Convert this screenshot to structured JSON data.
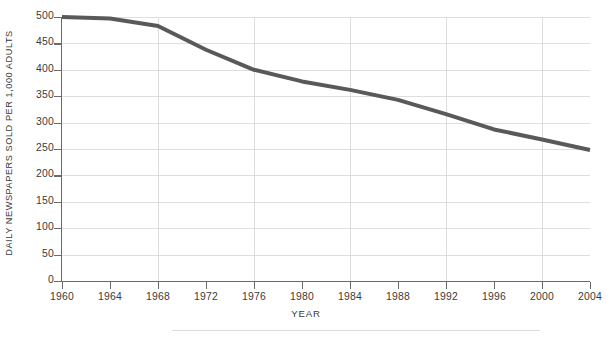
{
  "chart_data": {
    "type": "line",
    "title": "",
    "xlabel": "YEAR",
    "ylabel": "DAILY NEWSPAPERS SOLD PER 1,000 ADULTS",
    "xlim": [
      1960,
      2004
    ],
    "ylim": [
      0,
      500
    ],
    "grid": true,
    "legend_position": "none",
    "x_tick_labels": [
      "1960",
      "1964",
      "1968",
      "1972",
      "1976",
      "1980",
      "1984",
      "1988",
      "1992",
      "1996",
      "2000",
      "2004"
    ],
    "y_tick_labels": [
      "0",
      "50",
      "100",
      "150",
      "200",
      "250",
      "300",
      "350",
      "400",
      "450",
      "500"
    ],
    "x_gridline_years": [
      1968,
      1976,
      1984,
      1992,
      2000
    ],
    "y_gridline_values": [
      50,
      100,
      150,
      200,
      250,
      300,
      350,
      400,
      450,
      500
    ],
    "x": [
      1960,
      1964,
      1968,
      1972,
      1976,
      1980,
      1984,
      1988,
      1992,
      1996,
      2000,
      2004
    ],
    "values": [
      500,
      497,
      483,
      438,
      400,
      378,
      362,
      343,
      316,
      287,
      268,
      248
    ],
    "series": [
      {
        "name": "Daily newspapers sold per 1,000 adults",
        "color": "#595959",
        "values": [
          500,
          497,
          483,
          438,
          400,
          378,
          362,
          343,
          316,
          287,
          268,
          248
        ]
      }
    ]
  },
  "clipped_title_fragment": "",
  "colors": {
    "line": "#595959",
    "grid": "#dedee2",
    "axis": "#6a6a6a",
    "text": "#3a3a3a",
    "background": "#ffffff"
  }
}
